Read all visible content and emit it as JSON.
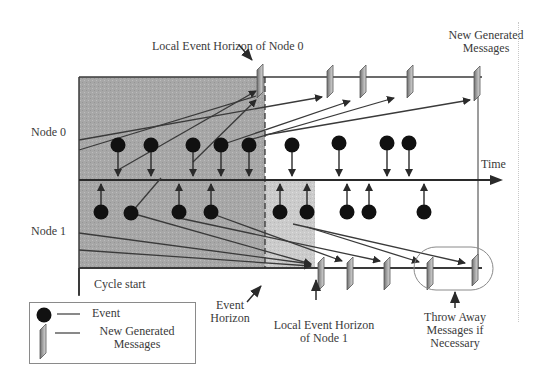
{
  "labels": {
    "node0": "Node 0",
    "node1": "Node 1",
    "time": "Time",
    "cycle_start": "Cycle start",
    "event_horizon_line1": "Event",
    "event_horizon_line2": "Horizon",
    "local_horizon_node0": "Local Event Horizon of Node 0",
    "new_generated_line1": "New Generated",
    "new_generated_line2": "Messages",
    "local_horizon_node1_line1": "Local Event Horizon",
    "local_horizon_node1_line2": "of Node 1",
    "throw_away_line1": "Throw Away",
    "throw_away_line2": "Messages if",
    "throw_away_line3": "Necessary"
  },
  "legend": {
    "event_label": "Event",
    "message_label_line1": "New Generated",
    "message_label_line2": "Messages"
  },
  "colors": {
    "shade": "#a9a9a9",
    "shade_light": "#cfcfcf",
    "line": "#3a3a3a",
    "event": "#111111",
    "message": "#9a9a9a"
  },
  "diagram": {
    "node0_events_x": [
      118,
      151,
      193,
      221,
      249,
      292,
      341,
      389,
      409
    ],
    "node1_events_x": [
      102,
      131,
      179,
      210,
      280,
      307,
      348,
      369,
      424
    ],
    "node0_messages_x": [
      260,
      327,
      353,
      411,
      482
    ],
    "node1_messages_x": [
      323,
      352,
      412,
      433,
      480
    ],
    "event_horizon_x": 265,
    "node1_local_horizon_x": 315
  }
}
